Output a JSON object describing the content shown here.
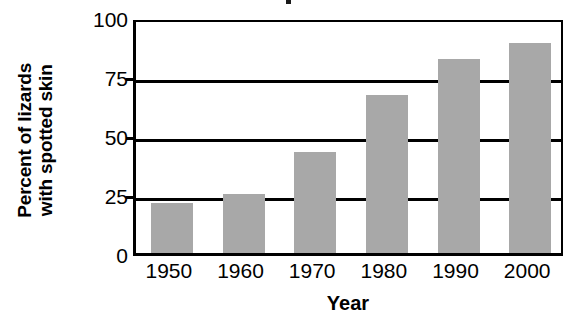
{
  "chart_data": {
    "type": "bar",
    "title": "",
    "xlabel": "Year",
    "ylabel": "Percent of lizards with spotted skin",
    "ylabel_lines": [
      "Percent of lizards",
      "with spotted skin"
    ],
    "categories": [
      "1950",
      "1960",
      "1970",
      "1980",
      "1990",
      "2000"
    ],
    "values": [
      21,
      25,
      43,
      67,
      82,
      89
    ],
    "ylim": [
      0,
      100
    ],
    "yticks": [
      0,
      25,
      50,
      75,
      100
    ],
    "ytick_labels": [
      "0",
      "25",
      "50",
      "75",
      "100"
    ],
    "grid": true,
    "grid_axis": "y",
    "legend": false,
    "bar_color": "#a8a8a8",
    "axis_color": "#000000",
    "background": "#ffffff"
  },
  "axes": {
    "y_title_line1": "Percent of lizards",
    "y_title_line2": "with spotted skin",
    "x_title": "Year"
  }
}
